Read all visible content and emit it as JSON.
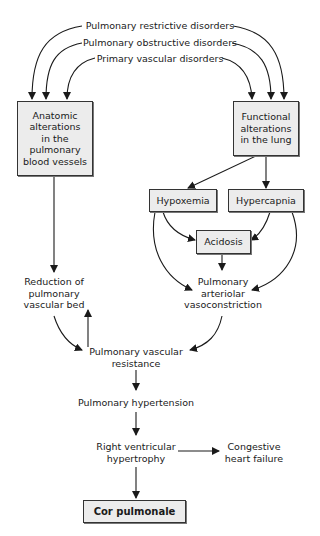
{
  "diagram": {
    "causes": [
      "Pulmonary restrictive disorders",
      "Pulmonary obstructive disorders",
      "Primary vascular disorders"
    ],
    "nodes": {
      "anatomic": "Anatomic alterations in the pulmonary blood vessels",
      "functional": "Functional alterations in the lung",
      "hypoxemia": "Hypoxemia",
      "hypercapnia": "Hypercapnia",
      "acidosis": "Acidosis",
      "reduction": "Reduction of pulmonary vascular bed",
      "vasoconstriction": "Pulmonary arteriolar vasoconstriction",
      "resistance": "Pulmonary vascular resistance",
      "hypertension": "Pulmonary hypertension",
      "rvh": "Right ventricular hypertrophy",
      "chf": "Congestive heart failure",
      "cor": "Cor pulmonale"
    },
    "lines": {
      "anatomic": [
        "Anatomic",
        "alterations",
        "in the",
        "pulmonary",
        "blood vessels"
      ],
      "functional": [
        "Functional",
        "alterations",
        "in the lung"
      ],
      "reduction": [
        "Reduction of",
        "pulmonary",
        "vascular bed"
      ],
      "vasoconstriction": [
        "Pulmonary",
        "arteriolar",
        "vasoconstriction"
      ],
      "resistance": [
        "Pulmonary vascular",
        "resistance"
      ],
      "rvh": [
        "Right ventricular",
        "hypertrophy"
      ],
      "chf": [
        "Congestive",
        "heart failure"
      ]
    },
    "colors": {
      "box_fill": "#ececec",
      "line": "#1a1a1a"
    }
  }
}
